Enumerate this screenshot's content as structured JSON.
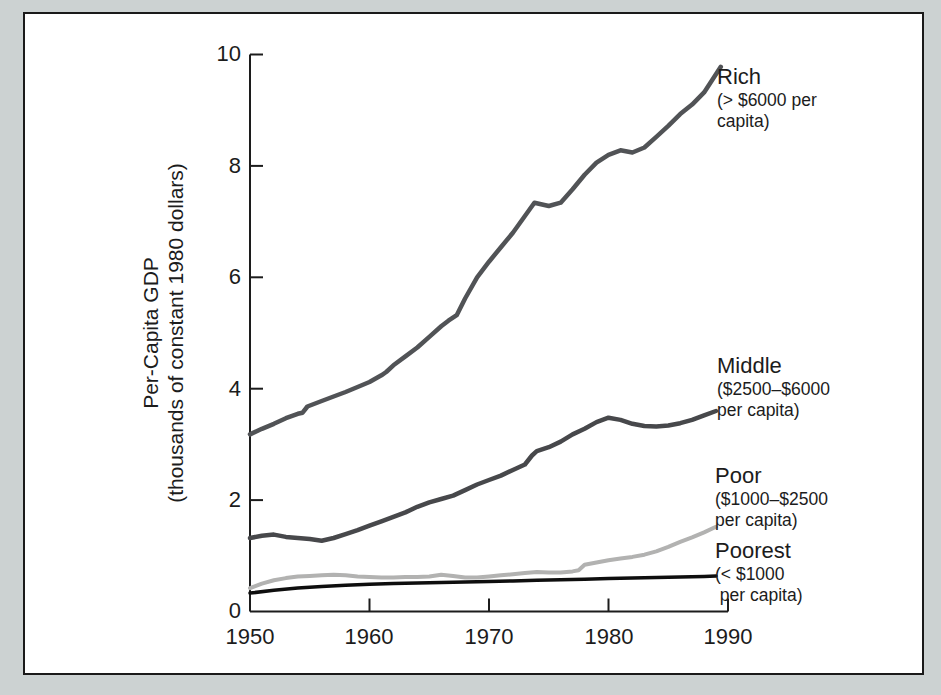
{
  "figure": {
    "background_color": "#ccd2d2",
    "frame_border_color": "#1a1a1a",
    "plot_background": "#ffffff",
    "axis_color": "#1c1c1c"
  },
  "chart_data": {
    "type": "line",
    "title": "",
    "ylabel_line1": "Per-Capita GDP",
    "ylabel_line2": "(thousands of constant 1980 dollars)",
    "xlabel": "",
    "xlim": [
      1950,
      1990
    ],
    "ylim": [
      0,
      10
    ],
    "grid": false,
    "legend_position": "inline-right-of-lines",
    "x_tick_labels": [
      "1950",
      "1960",
      "1970",
      "1980",
      "1990"
    ],
    "y_tick_labels": [
      "0",
      "2",
      "4",
      "6",
      "8",
      "10"
    ],
    "series": [
      {
        "name": "Rich",
        "qualifier_lines": [
          "(> $6000 per",
          "capita)"
        ],
        "color": "#515356",
        "width": 4.5,
        "points": [
          [
            1950,
            3.18
          ],
          [
            1951,
            3.28
          ],
          [
            1952,
            3.37
          ],
          [
            1953,
            3.47
          ],
          [
            1954,
            3.55
          ],
          [
            1954.4,
            3.57
          ],
          [
            1954.8,
            3.68
          ],
          [
            1956,
            3.78
          ],
          [
            1957,
            3.86
          ],
          [
            1958,
            3.94
          ],
          [
            1959,
            4.03
          ],
          [
            1960,
            4.12
          ],
          [
            1961,
            4.24
          ],
          [
            1961.4,
            4.3
          ],
          [
            1962,
            4.42
          ],
          [
            1963,
            4.58
          ],
          [
            1964,
            4.74
          ],
          [
            1965,
            4.93
          ],
          [
            1966,
            5.12
          ],
          [
            1966.6,
            5.22
          ],
          [
            1967.3,
            5.32
          ],
          [
            1968,
            5.62
          ],
          [
            1969,
            6.0
          ],
          [
            1970,
            6.28
          ],
          [
            1971,
            6.54
          ],
          [
            1972,
            6.8
          ],
          [
            1973,
            7.1
          ],
          [
            1973.8,
            7.34
          ],
          [
            1975,
            7.28
          ],
          [
            1976,
            7.34
          ],
          [
            1977,
            7.58
          ],
          [
            1978,
            7.84
          ],
          [
            1979,
            8.06
          ],
          [
            1980,
            8.2
          ],
          [
            1981,
            8.28
          ],
          [
            1982,
            8.24
          ],
          [
            1983,
            8.33
          ],
          [
            1984,
            8.52
          ],
          [
            1985,
            8.72
          ],
          [
            1986,
            8.93
          ],
          [
            1987,
            9.1
          ],
          [
            1988,
            9.32
          ],
          [
            1989.4,
            9.78
          ]
        ]
      },
      {
        "name": "Middle",
        "qualifier_lines": [
          "($2500–$6000",
          "per capita)"
        ],
        "color": "#47484b",
        "width": 4.5,
        "points": [
          [
            1950,
            1.32
          ],
          [
            1951,
            1.36
          ],
          [
            1952,
            1.38
          ],
          [
            1953,
            1.34
          ],
          [
            1954,
            1.32
          ],
          [
            1955,
            1.3
          ],
          [
            1956,
            1.27
          ],
          [
            1957,
            1.32
          ],
          [
            1958,
            1.39
          ],
          [
            1959,
            1.46
          ],
          [
            1960,
            1.54
          ],
          [
            1961,
            1.62
          ],
          [
            1962,
            1.7
          ],
          [
            1963,
            1.78
          ],
          [
            1964,
            1.88
          ],
          [
            1965,
            1.96
          ],
          [
            1966,
            2.02
          ],
          [
            1967,
            2.08
          ],
          [
            1968,
            2.18
          ],
          [
            1969,
            2.28
          ],
          [
            1970,
            2.36
          ],
          [
            1971,
            2.44
          ],
          [
            1972,
            2.54
          ],
          [
            1973,
            2.64
          ],
          [
            1973.6,
            2.8
          ],
          [
            1974,
            2.88
          ],
          [
            1975,
            2.95
          ],
          [
            1976,
            3.05
          ],
          [
            1977,
            3.18
          ],
          [
            1978,
            3.28
          ],
          [
            1979,
            3.4
          ],
          [
            1980,
            3.48
          ],
          [
            1981,
            3.44
          ],
          [
            1982,
            3.37
          ],
          [
            1983,
            3.33
          ],
          [
            1984,
            3.32
          ],
          [
            1985,
            3.34
          ],
          [
            1986,
            3.38
          ],
          [
            1987,
            3.44
          ],
          [
            1988,
            3.52
          ],
          [
            1989,
            3.6
          ]
        ]
      },
      {
        "name": "Poor",
        "qualifier_lines": [
          "($1000–$2500",
          "per capita)"
        ],
        "color": "#b2b2b1",
        "width": 4,
        "points": [
          [
            1950,
            0.42
          ],
          [
            1951,
            0.5
          ],
          [
            1952,
            0.56
          ],
          [
            1953,
            0.6
          ],
          [
            1954,
            0.63
          ],
          [
            1955,
            0.64
          ],
          [
            1956,
            0.65
          ],
          [
            1957,
            0.66
          ],
          [
            1958,
            0.65
          ],
          [
            1959,
            0.63
          ],
          [
            1960,
            0.62
          ],
          [
            1961,
            0.61
          ],
          [
            1962,
            0.61
          ],
          [
            1963,
            0.62
          ],
          [
            1964,
            0.62
          ],
          [
            1965,
            0.63
          ],
          [
            1966,
            0.66
          ],
          [
            1967,
            0.64
          ],
          [
            1968,
            0.61
          ],
          [
            1969,
            0.61
          ],
          [
            1970,
            0.63
          ],
          [
            1971,
            0.65
          ],
          [
            1972,
            0.67
          ],
          [
            1973,
            0.69
          ],
          [
            1974,
            0.71
          ],
          [
            1975,
            0.7
          ],
          [
            1976,
            0.7
          ],
          [
            1977,
            0.72
          ],
          [
            1977.5,
            0.74
          ],
          [
            1978,
            0.84
          ],
          [
            1979,
            0.88
          ],
          [
            1980,
            0.92
          ],
          [
            1981,
            0.95
          ],
          [
            1982,
            0.98
          ],
          [
            1983,
            1.02
          ],
          [
            1984,
            1.08
          ],
          [
            1985,
            1.16
          ],
          [
            1986,
            1.25
          ],
          [
            1987,
            1.33
          ],
          [
            1988,
            1.42
          ],
          [
            1989,
            1.52
          ]
        ]
      },
      {
        "name": "Poorest",
        "qualifier_lines": [
          "(< $1000",
          " per capita)"
        ],
        "color": "#0e0e0e",
        "width": 3.5,
        "points": [
          [
            1950,
            0.33
          ],
          [
            1952,
            0.38
          ],
          [
            1954,
            0.42
          ],
          [
            1956,
            0.45
          ],
          [
            1958,
            0.47
          ],
          [
            1960,
            0.49
          ],
          [
            1962,
            0.5
          ],
          [
            1964,
            0.51
          ],
          [
            1966,
            0.52
          ],
          [
            1968,
            0.53
          ],
          [
            1970,
            0.54
          ],
          [
            1972,
            0.55
          ],
          [
            1974,
            0.56
          ],
          [
            1976,
            0.57
          ],
          [
            1978,
            0.58
          ],
          [
            1980,
            0.59
          ],
          [
            1982,
            0.6
          ],
          [
            1984,
            0.61
          ],
          [
            1986,
            0.62
          ],
          [
            1988,
            0.63
          ],
          [
            1989,
            0.64
          ]
        ]
      }
    ]
  }
}
